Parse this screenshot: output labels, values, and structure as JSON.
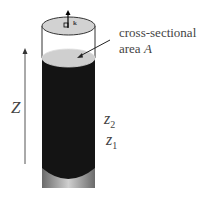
{
  "diagram": {
    "labels": {
      "cross_sectional_line1": "cross-sectional",
      "cross_sectional_line2": "area ",
      "area_symbol": "A",
      "z_axis": "Z",
      "k_vector": "k",
      "z2": "z",
      "z2_sub": "2",
      "z1": "z",
      "z1_sub": "1"
    },
    "colors": {
      "ellipse_fill": "#d2d2d2",
      "column_dark": "#141414",
      "outline": "#222222",
      "base_gray": "#a0a0a0"
    }
  }
}
